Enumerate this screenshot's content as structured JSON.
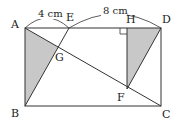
{
  "diagram": {
    "type": "geometry",
    "colors": {
      "line": "#333333",
      "shade": "#c8c8c8",
      "background": "#ffffff"
    },
    "points": {
      "A": {
        "label": "A",
        "x": 25,
        "y": 28
      },
      "B": {
        "label": "B",
        "x": 25,
        "y": 106
      },
      "C": {
        "label": "C",
        "x": 161,
        "y": 106
      },
      "D": {
        "label": "D",
        "x": 161,
        "y": 28
      },
      "E": {
        "label": "E",
        "x": 69,
        "y": 28
      },
      "H": {
        "label": "H",
        "x": 127,
        "y": 28
      },
      "F": {
        "label": "F",
        "x": 127,
        "y": 89
      },
      "G": {
        "label": "G",
        "x": 58,
        "y": 47
      }
    },
    "dimensions": [
      {
        "label": "4 cm",
        "from": "A",
        "to": "E"
      },
      {
        "label": "8 cm",
        "from": "E",
        "to": "D"
      }
    ],
    "shaded_regions": [
      "triangle ABG",
      "triangle HFD"
    ],
    "right_angle_mark": "H"
  }
}
